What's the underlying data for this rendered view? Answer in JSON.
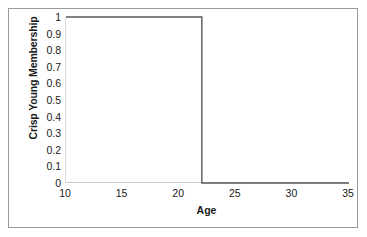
{
  "chart_data": {
    "type": "line",
    "title": "",
    "xlabel": "Age",
    "ylabel": "Crisp Young Membership",
    "xlim": [
      10,
      35
    ],
    "ylim": [
      0,
      1
    ],
    "grid": false,
    "legend": null,
    "x_ticks": [
      "10",
      "15",
      "20",
      "25",
      "30",
      "35"
    ],
    "x_tick_values": [
      10,
      15,
      20,
      25,
      30,
      35
    ],
    "y_ticks": [
      "1",
      "0.9",
      "0.8",
      "0.7",
      "0.6",
      "0.5",
      "0.4",
      "0.3",
      "0.2",
      "0.1",
      "0"
    ],
    "y_tick_values": [
      1,
      0.9,
      0.8,
      0.7,
      0.6,
      0.5,
      0.4,
      0.3,
      0.2,
      0.1,
      0
    ],
    "series": [
      {
        "name": "Crisp Young Membership",
        "color": "#595959",
        "step_at": 22,
        "x": [
          10,
          22,
          22,
          35
        ],
        "values": [
          1,
          1,
          0,
          0
        ]
      }
    ],
    "annotations": []
  },
  "figure": {
    "border_color": "#9a9a9a",
    "background": "#ffffff",
    "axis_color": "#c9c9c9",
    "text_color": "#1a1a1a"
  }
}
